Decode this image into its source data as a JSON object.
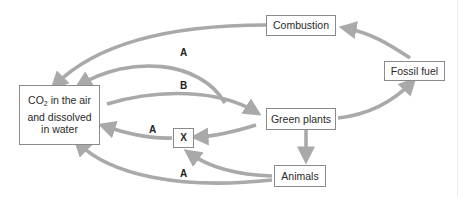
{
  "diagram": {
    "type": "carbon-cycle",
    "arrow_color": "#a9a9a9",
    "nodes": {
      "co2": {
        "line1_pre": "CO",
        "line1_sub": "2",
        "line1_post": " in the air",
        "line2": "and dissolved",
        "line3": "in water"
      },
      "combustion": {
        "label": "Combustion"
      },
      "fossil_fuel": {
        "label": "Fossil fuel"
      },
      "green_plants": {
        "label": "Green plants"
      },
      "animals": {
        "label": "Animals"
      },
      "x": {
        "label": "X"
      }
    },
    "arrow_labels": {
      "a_top": "A",
      "b": "B",
      "a_middle": "A",
      "a_bottom": "A"
    },
    "edges": [
      {
        "from": "combustion",
        "to": "co2"
      },
      {
        "from": "green_plants",
        "to": "co2",
        "label": "A"
      },
      {
        "from": "co2",
        "to": "green_plants",
        "label": "B"
      },
      {
        "from": "green_plants",
        "to": "x"
      },
      {
        "from": "x",
        "to": "co2",
        "label": "A"
      },
      {
        "from": "animals",
        "to": "x"
      },
      {
        "from": "animals",
        "to": "co2",
        "label": "A"
      },
      {
        "from": "green_plants",
        "to": "animals"
      },
      {
        "from": "green_plants",
        "to": "fossil_fuel"
      },
      {
        "from": "fossil_fuel",
        "to": "combustion"
      }
    ]
  }
}
